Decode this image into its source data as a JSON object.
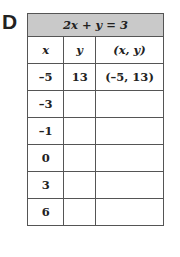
{
  "problem_label": "D",
  "table": {
    "title": "2x + y = 3",
    "headers": [
      "x",
      "y",
      "(x, y)"
    ],
    "rows": [
      {
        "x": "–5",
        "y": "13",
        "xy": "(–5, 13)"
      },
      {
        "x": "–3",
        "y": "",
        "xy": ""
      },
      {
        "x": "–1",
        "y": "",
        "xy": ""
      },
      {
        "x": "0",
        "y": "",
        "xy": ""
      },
      {
        "x": "3",
        "y": "",
        "xy": ""
      },
      {
        "x": "6",
        "y": "",
        "xy": ""
      }
    ]
  },
  "colors": {
    "header_fill": "#c9c9c9",
    "border": "#555555",
    "text": "#222222"
  }
}
